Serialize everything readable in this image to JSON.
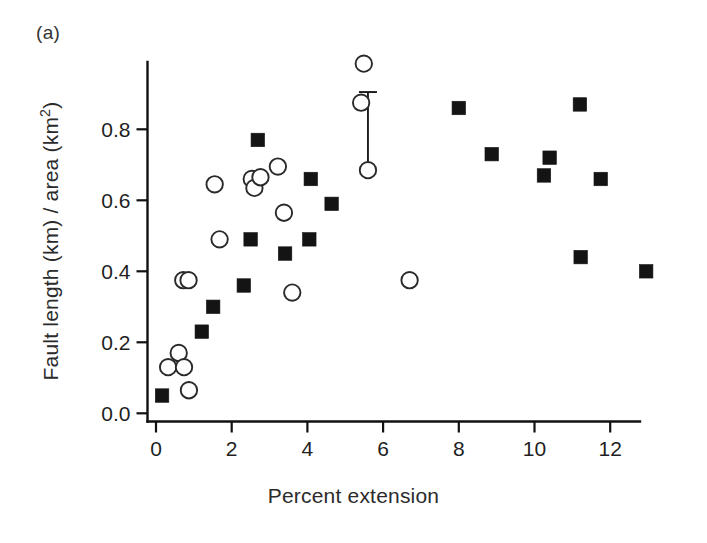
{
  "panel": {
    "label": "(a)"
  },
  "axes": {
    "xlabel": "Percent extension",
    "ylabel_text": "Fault length (km) / area (km",
    "ylabel_sup": "2",
    "ylabel_tail": ")",
    "ylabel_full": "Fault length (km) / area (km2)",
    "x_ticks": [
      "0",
      "2",
      "4",
      "6",
      "8",
      "10",
      "12"
    ],
    "y_ticks": [
      "0.0",
      "0.2",
      "0.4",
      "0.6",
      "0.8"
    ]
  },
  "colors": {
    "axis": "#111111",
    "square_marker": "#141414",
    "circle_marker_stroke": "#2a2a2a",
    "circle_marker_fill": "#ffffff",
    "background": "#ffffff",
    "text": "#1f1f1f"
  },
  "chart_data": {
    "type": "scatter",
    "title": "",
    "subtitle": "",
    "panel_label": "(a)",
    "xlabel": "Percent extension",
    "ylabel": "Fault length (km) / area (km2)",
    "xlim": [
      0.0,
      13.5
    ],
    "ylim": [
      0.0,
      1.02
    ],
    "x_tick_values": [
      0,
      2,
      4,
      6,
      8,
      10,
      12
    ],
    "y_tick_values": [
      0.0,
      0.2,
      0.4,
      0.6,
      0.8
    ],
    "grid": false,
    "legend": false,
    "legend_position": "none",
    "series": [
      {
        "name": "filled-squares",
        "marker": "square",
        "fill": "#141414",
        "points": [
          {
            "x": 0.16,
            "y": 0.05
          },
          {
            "x": 1.21,
            "y": 0.23
          },
          {
            "x": 1.51,
            "y": 0.3
          },
          {
            "x": 2.32,
            "y": 0.36
          },
          {
            "x": 2.5,
            "y": 0.49
          },
          {
            "x": 2.69,
            "y": 0.77
          },
          {
            "x": 3.41,
            "y": 0.45
          },
          {
            "x": 4.05,
            "y": 0.49
          },
          {
            "x": 4.09,
            "y": 0.66
          },
          {
            "x": 4.64,
            "y": 0.59
          },
          {
            "x": 8.0,
            "y": 0.86
          },
          {
            "x": 8.87,
            "y": 0.73
          },
          {
            "x": 10.25,
            "y": 0.67
          },
          {
            "x": 10.4,
            "y": 0.72
          },
          {
            "x": 11.2,
            "y": 0.87
          },
          {
            "x": 11.22,
            "y": 0.44
          },
          {
            "x": 11.75,
            "y": 0.66
          },
          {
            "x": 12.95,
            "y": 0.4
          }
        ]
      },
      {
        "name": "open-circles",
        "marker": "circle",
        "fill": "#ffffff",
        "points": [
          {
            "x": 0.32,
            "y": 0.13
          },
          {
            "x": 0.6,
            "y": 0.17
          },
          {
            "x": 0.72,
            "y": 0.375
          },
          {
            "x": 0.86,
            "y": 0.375
          },
          {
            "x": 0.74,
            "y": 0.13
          },
          {
            "x": 0.87,
            "y": 0.065
          },
          {
            "x": 1.55,
            "y": 0.645
          },
          {
            "x": 1.68,
            "y": 0.49
          },
          {
            "x": 2.53,
            "y": 0.66
          },
          {
            "x": 2.6,
            "y": 0.635
          },
          {
            "x": 2.76,
            "y": 0.665
          },
          {
            "x": 3.22,
            "y": 0.695
          },
          {
            "x": 3.38,
            "y": 0.565
          },
          {
            "x": 3.6,
            "y": 0.34
          },
          {
            "x": 5.42,
            "y": 0.875
          },
          {
            "x": 5.49,
            "y": 0.985
          },
          {
            "x": 5.6,
            "y": 0.685
          },
          {
            "x": 6.7,
            "y": 0.375
          }
        ]
      }
    ],
    "errorbars": [
      {
        "x": 5.6,
        "y": 0.685,
        "upper": 0.905,
        "lower": 0.685
      }
    ]
  }
}
